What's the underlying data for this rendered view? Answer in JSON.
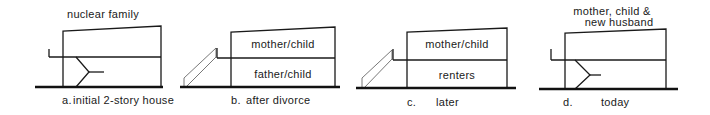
{
  "diagram": {
    "type": "house-section-sequence",
    "panels": [
      {
        "id": "a",
        "title": "nuclear family",
        "caption_letter": "a.",
        "caption_text": "initial 2-story house",
        "rooms": [],
        "features": [
          "exterior-stub-wall",
          "interior-stair"
        ]
      },
      {
        "id": "b",
        "title": "",
        "caption_letter": "b.",
        "caption_text": "after divorce",
        "rooms": [
          {
            "floor": "upper",
            "label": "mother/child"
          },
          {
            "floor": "lower",
            "label": "father/child"
          }
        ],
        "features": [
          "exterior-stair"
        ]
      },
      {
        "id": "c",
        "title": "",
        "caption_letter": "c.",
        "caption_text": "later",
        "rooms": [
          {
            "floor": "upper",
            "label": "mother/child"
          },
          {
            "floor": "lower",
            "label": "renters"
          }
        ],
        "features": [
          "exterior-stair"
        ]
      },
      {
        "id": "d",
        "title_line1": "mother, child &",
        "title_line2": "new husband",
        "caption_letter": "d.",
        "caption_text": "today",
        "rooms": [],
        "features": [
          "exterior-stub-wall",
          "interior-stair"
        ]
      }
    ]
  }
}
